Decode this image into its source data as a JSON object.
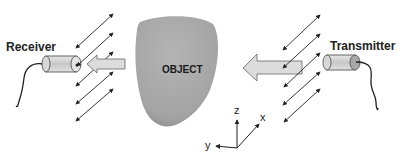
{
  "diagram": {
    "labels": {
      "receiver": "Receiver",
      "transmitter": "Transmitter",
      "object": "OBJECT"
    },
    "axes": {
      "z": "z",
      "x": "x",
      "y": "y"
    },
    "colors": {
      "object_fill": "#a9a9a9",
      "arrow_fill": "#dcdcdc",
      "cylinder_fill": "#cfcfcf",
      "line": "#222222"
    }
  }
}
